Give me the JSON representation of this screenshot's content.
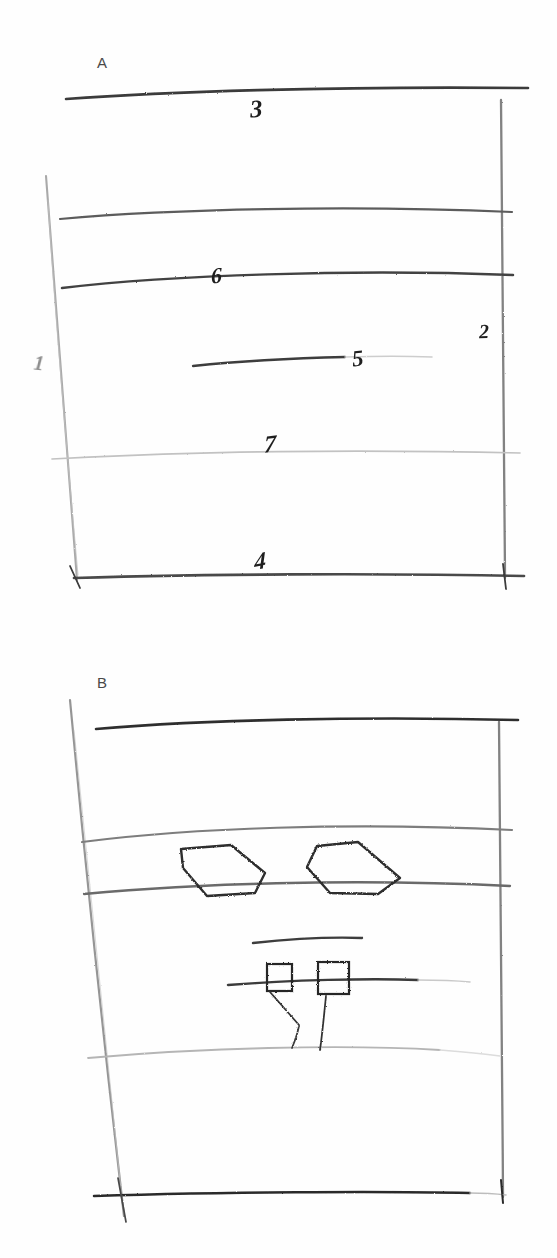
{
  "figure": {
    "medium": "pencil sketch",
    "background_color": "#fefefe",
    "stroke_color": "#2b2b2b",
    "faint_stroke_color": "#b9b9b9"
  },
  "panels": [
    {
      "id": "A",
      "letter": "A",
      "description": "Upper panel: trapezoidal frame containing six horizontal stratum lines with numbered reference callouts",
      "bounds": {
        "x": 60,
        "y": 80,
        "width": 460,
        "height": 510
      },
      "reference_numerals": [
        {
          "label": "3",
          "x": 250,
          "y": 96,
          "points_to": "top-boundary-line"
        },
        {
          "label": "6",
          "x": 211,
          "y": 265,
          "points_to": "third-stratum-line"
        },
        {
          "label": "5",
          "x": 352,
          "y": 347,
          "points_to": "short-middle-segment"
        },
        {
          "label": "7",
          "x": 264,
          "y": 432,
          "points_to": "faint-lower-stratum-line"
        },
        {
          "label": "4",
          "x": 254,
          "y": 549,
          "points_to": "bottom-boundary-line"
        },
        {
          "label": "2",
          "x": 479,
          "y": 321,
          "points_to": "right-vertical-border"
        },
        {
          "label": "1",
          "x": 34,
          "y": 353,
          "points_to": "left-vertical-border"
        }
      ]
    },
    {
      "id": "B",
      "letter": "B",
      "description": "Lower panel: trapezoidal frame with two hexagonal shapes between an upper stratum band, and two small squares straddling a lower line with leader lines",
      "bounds": {
        "x": 60,
        "y": 700,
        "width": 460,
        "height": 500
      },
      "reference_numerals": []
    }
  ],
  "strata": {
    "panel_a": [
      {
        "name": "top-boundary-line",
        "y_left": 97,
        "y_right": 88,
        "weight": "heavy",
        "x_start": 66,
        "x_end": 528
      },
      {
        "name": "second-stratum-line",
        "y_left": 218,
        "y_right": 210,
        "weight": "medium",
        "x_start": 60,
        "x_end": 510
      },
      {
        "name": "third-stratum-line",
        "y_left": 286,
        "y_right": 272,
        "weight": "heavy",
        "x_start": 62,
        "x_end": 512
      },
      {
        "name": "short-middle-segment",
        "y_left": 363,
        "y_right": 356,
        "weight": "light",
        "x_start": 193,
        "x_end": 430
      },
      {
        "name": "faint-lower-stratum-line",
        "y_left": 457,
        "y_right": 450,
        "weight": "faint",
        "x_start": 52,
        "x_end": 520
      },
      {
        "name": "bottom-boundary-line",
        "y_left": 576,
        "y_right": 574,
        "weight": "heavy",
        "x_start": 74,
        "x_end": 524
      }
    ],
    "panel_b": [
      {
        "name": "top-boundary-line",
        "y_left": 727,
        "y_right": 718,
        "weight": "heavy",
        "x_start": 96,
        "x_end": 518
      },
      {
        "name": "band-upper-line",
        "y_left": 840,
        "y_right": 826,
        "weight": "medium",
        "x_start": 82,
        "x_end": 512
      },
      {
        "name": "band-lower-line",
        "y_left": 892,
        "y_right": 882,
        "weight": "medium",
        "x_start": 84,
        "x_end": 510
      },
      {
        "name": "short-upper-segment",
        "y_left": 941,
        "y_right": 937,
        "weight": "medium",
        "x_start": 253,
        "x_end": 362
      },
      {
        "name": "square-baseline",
        "y_left": 983,
        "y_right": 978,
        "weight": "medium",
        "x_start": 228,
        "x_end": 430
      },
      {
        "name": "faint-lower-stratum-line",
        "y_left": 1056,
        "y_right": 1046,
        "weight": "faint",
        "x_start": 88,
        "x_end": 500
      },
      {
        "name": "bottom-boundary-line",
        "y_left": 1194,
        "y_right": 1192,
        "weight": "heavy",
        "x_start": 94,
        "x_end": 506
      }
    ]
  },
  "shapes": {
    "hexagons": [
      {
        "name": "hexagon-left",
        "points": "181,849 231,845 265,873 255,893 207,896 183,868"
      },
      {
        "name": "hexagon-right",
        "points": "317,846 358,842 400,878 378,894 330,893 307,867"
      }
    ],
    "squares": [
      {
        "name": "square-left",
        "x": 267,
        "y": 964,
        "width": 25,
        "height": 27
      },
      {
        "name": "square-right",
        "x": 318,
        "y": 962,
        "width": 31,
        "height": 32
      }
    ],
    "leader_lines": [
      {
        "name": "leader-line-left",
        "x1": 270,
        "y1": 991,
        "x2": 298,
        "y2": 1024
      },
      {
        "name": "leader-line-left-tail",
        "x1": 298,
        "y1": 1024,
        "x2": 293,
        "y2": 1046
      },
      {
        "name": "leader-line-right",
        "x1": 325,
        "y1": 996,
        "x2": 320,
        "y2": 1048
      }
    ]
  },
  "borders": {
    "panel_a_left": {
      "x1": 46,
      "y1": 175,
      "x2": 78,
      "y2": 580
    },
    "panel_a_right": {
      "x1": 502,
      "y1": 102,
      "x2": 505,
      "y2": 578
    },
    "panel_b_left": {
      "x1": 72,
      "y1": 700,
      "x2": 124,
      "y2": 1215
    },
    "panel_b_right": {
      "x1": 500,
      "y1": 722,
      "x2": 503,
      "y2": 1196
    }
  }
}
